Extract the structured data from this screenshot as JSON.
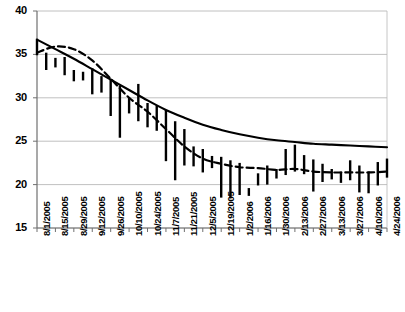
{
  "chart_data": {
    "type": "bar",
    "subtype": "high-low-range-bars-with-lines",
    "title": "",
    "subtitle": "",
    "xlabel": "",
    "ylabel": "",
    "ylim": [
      15,
      40
    ],
    "ytick_values": [
      15,
      20,
      25,
      30,
      35,
      40
    ],
    "ytick_labels": [
      "15",
      "20",
      "25",
      "30",
      "35",
      "40"
    ],
    "grid": true,
    "grid_axis": "y",
    "legend": false,
    "legend_position": "none",
    "xtick_labels": [
      "8/1/2005",
      "8/15/2005",
      "8/29/2005",
      "9/12/2005",
      "9/26/2005",
      "10/10/2005",
      "10/24/2005",
      "11/7/2005",
      "11/21/2005",
      "12/5/2005",
      "12/19/2005",
      "1/2/2006",
      "1/16/2006",
      "1/30/2006",
      "2/13/2006",
      "2/27/2006",
      "3/13/2006",
      "3/27/2006",
      "4/10/2006",
      "4/24/2006"
    ],
    "xtick_interval_days": 14,
    "x_start": "8/1/2005",
    "x_end": "4/24/2006",
    "colors": {
      "bars": "#000000",
      "solid_line": "#000000",
      "dashed_line": "#000000",
      "gridlines": "#b0b0b0",
      "axis": "#808080",
      "background": "#ffffff"
    },
    "series": [
      {
        "name": "weekly-range-bars",
        "type": "bar",
        "render": "vertical-high-low",
        "x": [
          "8/1/2005",
          "8/8/2005",
          "8/15/2005",
          "8/22/2005",
          "8/29/2005",
          "9/5/2005",
          "9/12/2005",
          "9/19/2005",
          "9/26/2005",
          "10/3/2005",
          "10/10/2005",
          "10/17/2005",
          "10/24/2005",
          "10/31/2005",
          "11/7/2005",
          "11/14/2005",
          "11/21/2005",
          "11/28/2005",
          "12/5/2005",
          "12/12/2005",
          "12/19/2005",
          "12/26/2005",
          "1/2/2006",
          "1/9/2006",
          "1/16/2006",
          "1/23/2006",
          "1/30/2006",
          "2/6/2006",
          "2/13/2006",
          "2/20/2006",
          "2/27/2006",
          "3/6/2006",
          "3/13/2006",
          "3/20/2006",
          "3/27/2006",
          "4/3/2006",
          "4/10/2006",
          "4/17/2006",
          "4/24/2006"
        ],
        "high": [
          36.8,
          35.2,
          34.6,
          34.7,
          33.2,
          33.0,
          33.4,
          32.5,
          32.2,
          31.4,
          30.0,
          31.6,
          29.4,
          29.1,
          28.6,
          27.3,
          26.4,
          24.4,
          24.1,
          23.3,
          23.2,
          22.8,
          22.5,
          19.6,
          21.3,
          22.2,
          21.8,
          24.1,
          24.6,
          23.4,
          22.9,
          22.4,
          21.8,
          21.5,
          22.8,
          22.2,
          21.5,
          22.6,
          23.0
        ],
        "low": [
          34.9,
          33.2,
          33.5,
          32.6,
          31.9,
          32.0,
          30.4,
          30.6,
          27.9,
          25.4,
          28.2,
          27.3,
          26.6,
          26.2,
          22.7,
          20.5,
          22.2,
          22.1,
          21.4,
          21.9,
          18.5,
          18.4,
          18.8,
          18.7,
          19.9,
          20.0,
          20.7,
          21.1,
          21.5,
          21.2,
          19.2,
          20.3,
          20.6,
          20.2,
          20.5,
          19.1,
          19.0,
          19.9,
          20.8
        ]
      },
      {
        "name": "solid-trend-line",
        "type": "line",
        "style": "solid",
        "x": [
          "8/1/2005",
          "8/15/2005",
          "8/29/2005",
          "9/12/2005",
          "9/26/2005",
          "10/10/2005",
          "10/24/2005",
          "11/7/2005",
          "11/21/2005",
          "12/5/2005",
          "12/19/2005",
          "1/2/2006",
          "1/16/2006",
          "1/30/2006",
          "2/13/2006",
          "2/27/2006",
          "3/13/2006",
          "3/27/2006",
          "4/10/2006",
          "4/24/2006"
        ],
        "values": [
          36.7,
          35.6,
          34.5,
          33.3,
          32.1,
          30.9,
          29.7,
          28.6,
          27.7,
          26.9,
          26.3,
          25.8,
          25.4,
          25.1,
          24.9,
          24.7,
          24.6,
          24.5,
          24.4,
          24.3
        ]
      },
      {
        "name": "dashed-fitted-line",
        "type": "line",
        "style": "dashed",
        "x": [
          "8/1/2005",
          "8/15/2005",
          "8/29/2005",
          "9/12/2005",
          "9/26/2005",
          "10/10/2005",
          "10/24/2005",
          "11/7/2005",
          "11/21/2005",
          "12/5/2005",
          "12/19/2005",
          "1/2/2006",
          "1/16/2006",
          "1/30/2006",
          "2/13/2006",
          "2/27/2006",
          "3/13/2006",
          "3/27/2006",
          "4/10/2006",
          "4/24/2006"
        ],
        "values": [
          35.2,
          35.9,
          35.6,
          34.3,
          32.2,
          30.0,
          28.4,
          26.4,
          24.4,
          23.0,
          22.4,
          22.0,
          21.9,
          21.7,
          21.8,
          21.5,
          21.4,
          21.4,
          21.4,
          21.5
        ]
      }
    ]
  },
  "plot": {
    "left_px": 37,
    "right_px": 387,
    "top_px": 11,
    "bottom_px": 228
  }
}
